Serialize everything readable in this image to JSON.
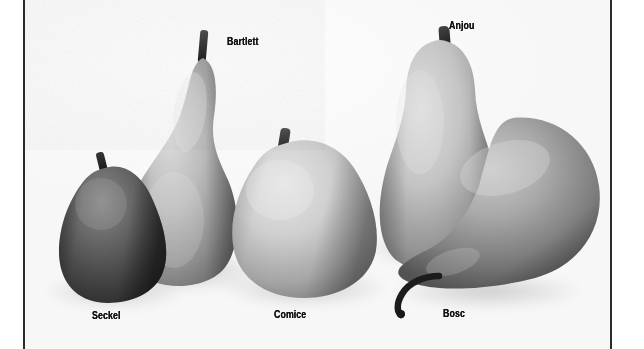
{
  "plate": {
    "title": "Pear Varieties",
    "medium": "black-and-white photograph",
    "background_color": "#fafafa",
    "rule_color": "#2b2b2b",
    "label_color": "#111111"
  },
  "frame": {
    "left_rule_x": 23,
    "right_rule_x": 610
  },
  "labels": [
    {
      "id": "bartlett",
      "text": "Bartlett",
      "x": 227,
      "y": 37
    },
    {
      "id": "anjou",
      "text": "Anjou",
      "x": 449,
      "y": 21
    },
    {
      "id": "seckel",
      "text": "Seckel",
      "x": 92,
      "y": 311
    },
    {
      "id": "comice",
      "text": "Comice",
      "x": 274,
      "y": 310
    },
    {
      "id": "bosc",
      "text": "Bosc",
      "x": 443,
      "y": 309
    }
  ],
  "specimens": [
    {
      "id": "seckel",
      "name": "Seckel",
      "tone": "darkest",
      "shape": "small squat pear",
      "fill_light": "#8b8b8b",
      "fill_dark": "#2e2e2e"
    },
    {
      "id": "bartlett",
      "name": "Bartlett",
      "tone": "mid",
      "shape": "tall classic pear with long neck",
      "fill_light": "#cfcbc4",
      "fill_dark": "#6b6761"
    },
    {
      "id": "comice",
      "name": "Comice",
      "tone": "lightest",
      "shape": "large round broad-bottomed pear",
      "fill_light": "#dedbd4",
      "fill_dark": "#8d8a83"
    },
    {
      "id": "anjou",
      "name": "Anjou",
      "tone": "light-mid",
      "shape": "short-necked egg-shaped pear",
      "fill_light": "#d5d2cb",
      "fill_dark": "#75726c"
    },
    {
      "id": "bosc",
      "name": "Bosc",
      "tone": "mid-dark",
      "shape": "long tapered pear lying on its side with curved stem",
      "fill_light": "#b9b6af",
      "fill_dark": "#5d5a55"
    }
  ]
}
